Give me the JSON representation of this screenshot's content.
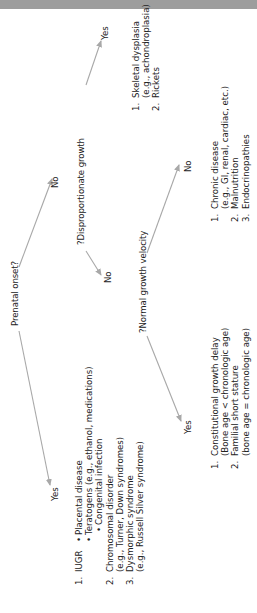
{
  "diagram": {
    "root_question": "Prenatal onset?",
    "root_yes_label": "Yes",
    "root_no_label": "No",
    "prenatal_causes": {
      "item1_num": "1.",
      "item1_label": "IUGR",
      "item1_bullets": [
        "Placental disease",
        "Teratogens (e.g., ethanol, medications)",
        "Congenital infection"
      ],
      "item2_num": "2.",
      "item2_label": "Chromosomal disorder",
      "item2_sub": "(e.g., Turner, Down syndromes)",
      "item3_num": "3.",
      "item3_label": "Dysmorphic syndrome",
      "item3_sub": "(e.g., Russell Silver syndrome)"
    },
    "disproportionate_question": "?Disproportionate growth",
    "disproportionate_yes_label": "Yes",
    "disproportionate_no_label": "No",
    "disproportionate_causes": {
      "item1_num": "1.",
      "item1_label": "Skeletal dysplasia",
      "item1_sub": "(e.g., achondroplasia)",
      "item2_num": "2.",
      "item2_label": "Rickets"
    },
    "velocity_question": "?Normal growth velocity",
    "velocity_yes_label": "Yes",
    "velocity_no_label": "No",
    "normal_velocity_causes": {
      "item1_num": "1.",
      "item1_label": "Constitutional growth delay",
      "item1_sub": "(Bone age < chronologic age)",
      "item2_num": "2.",
      "item2_label": "Familial short stature",
      "item2_sub": "(bone age = chronologic age)"
    },
    "abnormal_velocity_causes": {
      "item1_num": "1.",
      "item1_label": "Chronic disease",
      "item1_sub": "(e.g., GI, renal, cardiac, etc.)",
      "item2_num": "2.",
      "item2_label": "Malnutrition",
      "item3_num": "3.",
      "item3_label": "Endocrinopathies"
    },
    "colors": {
      "arrow": "#a8a8a8",
      "text": "#222222",
      "top_bar": "#9d9d9d"
    }
  }
}
